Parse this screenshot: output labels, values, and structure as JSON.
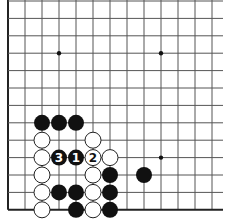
{
  "board": {
    "visible_columns": 13,
    "visible_rows": 13,
    "origin_x": 8,
    "origin_y": 1,
    "spacing_x": 17,
    "spacing_y": 17.4,
    "right_extent": 223,
    "top_extent": 0,
    "edges": [
      "left",
      "bottom"
    ],
    "line_color": "#555555",
    "edge_color": "#222222",
    "background": "#ffffff"
  },
  "star_points": [
    {
      "col": 3,
      "row": 3
    },
    {
      "col": 9,
      "row": 3
    },
    {
      "col": 9,
      "row": 9
    }
  ],
  "stones": [
    {
      "color": "black",
      "col": 2,
      "row": 7,
      "label": ""
    },
    {
      "color": "black",
      "col": 3,
      "row": 7,
      "label": ""
    },
    {
      "color": "black",
      "col": 4,
      "row": 7,
      "label": ""
    },
    {
      "color": "white",
      "col": 2,
      "row": 8,
      "label": ""
    },
    {
      "color": "white",
      "col": 5,
      "row": 8,
      "label": ""
    },
    {
      "color": "white",
      "col": 2,
      "row": 9,
      "label": ""
    },
    {
      "color": "black",
      "col": 3,
      "row": 9,
      "label": "3"
    },
    {
      "color": "black",
      "col": 4,
      "row": 9,
      "label": "1"
    },
    {
      "color": "white",
      "col": 5,
      "row": 9,
      "label": "2"
    },
    {
      "color": "white",
      "col": 6,
      "row": 9,
      "label": ""
    },
    {
      "color": "white",
      "col": 2,
      "row": 10,
      "label": ""
    },
    {
      "color": "white",
      "col": 5,
      "row": 10,
      "label": ""
    },
    {
      "color": "black",
      "col": 6,
      "row": 10,
      "label": ""
    },
    {
      "color": "black",
      "col": 8,
      "row": 10,
      "label": ""
    },
    {
      "color": "white",
      "col": 2,
      "row": 11,
      "label": ""
    },
    {
      "color": "black",
      "col": 3,
      "row": 11,
      "label": ""
    },
    {
      "color": "black",
      "col": 4,
      "row": 11,
      "label": ""
    },
    {
      "color": "white",
      "col": 5,
      "row": 11,
      "label": ""
    },
    {
      "color": "black",
      "col": 6,
      "row": 11,
      "label": ""
    },
    {
      "color": "white",
      "col": 2,
      "row": 12,
      "label": ""
    },
    {
      "color": "black",
      "col": 4,
      "row": 12,
      "label": ""
    },
    {
      "color": "white",
      "col": 5,
      "row": 12,
      "label": ""
    },
    {
      "color": "black",
      "col": 6,
      "row": 12,
      "label": ""
    }
  ],
  "move_labels": [
    "1",
    "2",
    "3"
  ]
}
